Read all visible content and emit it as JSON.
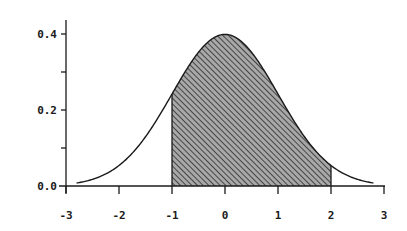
{
  "chart_data": {
    "type": "area",
    "title": "",
    "subtitle": "",
    "xlabel": "",
    "ylabel": "",
    "xlim": [
      -3,
      3
    ],
    "ylim": [
      0.0,
      0.4
    ],
    "x_ticks": [
      -3,
      -2,
      -1,
      0,
      1,
      2,
      3
    ],
    "x_tick_labels": [
      "-3",
      "-2",
      "-1",
      "0",
      "1",
      "2",
      "3"
    ],
    "y_ticks": [
      0.0,
      0.1,
      0.2,
      0.3,
      0.4
    ],
    "y_tick_labels": [
      "0.0",
      "",
      "0.2",
      "",
      "0.4"
    ],
    "grid": false,
    "legend": null,
    "curve": {
      "name": "Normal density N(0,1)",
      "x_range": [
        -2.8,
        2.8
      ],
      "x": [
        -2.8,
        -2.5,
        -2.0,
        -1.5,
        -1.0,
        -0.5,
        0.0,
        0.5,
        1.0,
        1.5,
        2.0,
        2.5,
        2.8
      ],
      "y": [
        0.008,
        0.018,
        0.054,
        0.13,
        0.242,
        0.352,
        0.399,
        0.352,
        0.242,
        0.13,
        0.054,
        0.018,
        0.008
      ]
    },
    "shaded_region": {
      "from": -1,
      "to": 2,
      "fill": "hatched",
      "fill_color": "#a8a8a8",
      "hatch_color": "#3a3a3a"
    },
    "colors": {
      "axis": "#1a1a1a",
      "curve": "#1a1a1a",
      "background": "#ffffff"
    }
  }
}
